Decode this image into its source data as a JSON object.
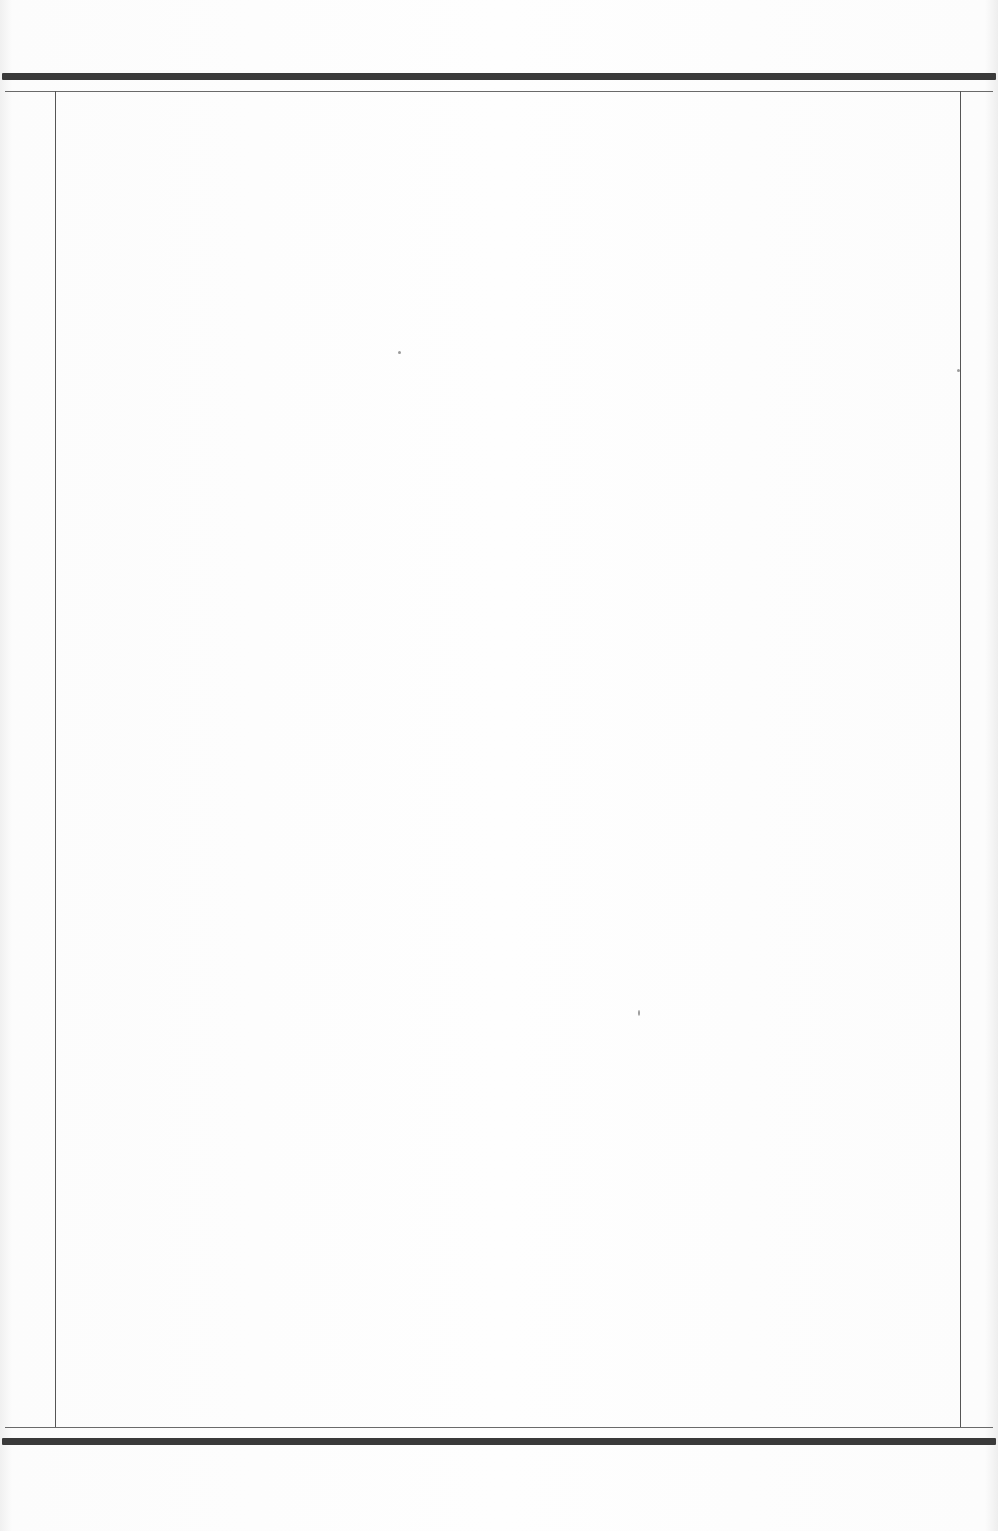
{
  "document": {
    "type": "blank ruled page",
    "body_text": ""
  },
  "colors": {
    "paper": "#fbfbfb",
    "thick_rule": "#3a3a3a",
    "thin_rule": "#6a6a6a",
    "margin_rule": "#555555"
  }
}
